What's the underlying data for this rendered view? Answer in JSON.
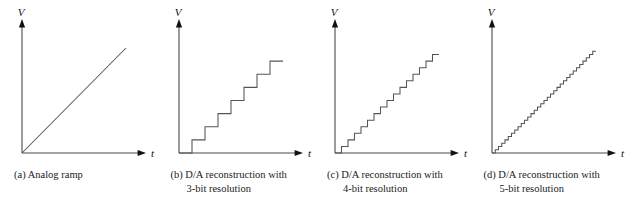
{
  "figure": {
    "background_color": "#ffffff",
    "line_color": "#555555",
    "axis_color": "#4a4a4a",
    "text_color": "#1a1a1a",
    "axis_labels": {
      "y": "V",
      "x": "t"
    }
  },
  "panels": [
    {
      "id": "panel-a",
      "caption_line_1": "(a) Analog ramp",
      "caption_line_2": "",
      "chart_index": 0
    },
    {
      "id": "panel-b",
      "caption_line_1": "(b) D/A reconstruction with",
      "caption_line_2": "3-bit resolution",
      "chart_index": 1
    },
    {
      "id": "panel-c",
      "caption_line_1": "(c) D/A reconstruction with",
      "caption_line_2": "4-bit resolution",
      "chart_index": 2
    },
    {
      "id": "panel-d",
      "caption_line_1": "(d) D/A reconstruction with",
      "caption_line_2": "5-bit resolution",
      "chart_index": 3
    }
  ],
  "chart_data": [
    {
      "type": "line",
      "title": "(a) Analog ramp",
      "xlabel": "t",
      "ylabel": "V",
      "grid": false,
      "legend": "none",
      "waveform": "ramp",
      "steps": 0,
      "xlim": [
        0,
        1
      ],
      "ylim": [
        0,
        1
      ],
      "x": [
        0,
        1
      ],
      "values": [
        0,
        1
      ],
      "description": "Continuous linear analog ramp from origin"
    },
    {
      "type": "line",
      "title": "(b) D/A reconstruction with 3-bit resolution",
      "xlabel": "t",
      "ylabel": "V",
      "grid": false,
      "legend": "none",
      "waveform": "staircase",
      "bits": 3,
      "steps": 8,
      "xlim": [
        0,
        1
      ],
      "ylim": [
        0,
        1
      ],
      "x": [
        0,
        0.125,
        0.25,
        0.375,
        0.5,
        0.625,
        0.75,
        0.875,
        1
      ],
      "values": [
        0,
        0.125,
        0.25,
        0.375,
        0.5,
        0.625,
        0.75,
        0.875,
        0.875
      ],
      "description": "Quantized staircase approximation with 8 levels"
    },
    {
      "type": "line",
      "title": "(c) D/A reconstruction with 4-bit resolution",
      "xlabel": "t",
      "ylabel": "V",
      "grid": false,
      "legend": "none",
      "waveform": "staircase",
      "bits": 4,
      "steps": 16,
      "xlim": [
        0,
        1
      ],
      "ylim": [
        0,
        1
      ],
      "x": [
        0,
        0.0625,
        0.125,
        0.1875,
        0.25,
        0.3125,
        0.375,
        0.4375,
        0.5,
        0.5625,
        0.625,
        0.6875,
        0.75,
        0.8125,
        0.875,
        0.9375,
        1
      ],
      "values": [
        0,
        0.0625,
        0.125,
        0.1875,
        0.25,
        0.3125,
        0.375,
        0.4375,
        0.5,
        0.5625,
        0.625,
        0.6875,
        0.75,
        0.8125,
        0.875,
        0.9375,
        0.9375
      ],
      "description": "Quantized staircase approximation with 16 levels"
    },
    {
      "type": "line",
      "title": "(d) D/A reconstruction with 5-bit resolution",
      "xlabel": "t",
      "ylabel": "V",
      "grid": false,
      "legend": "none",
      "waveform": "staircase",
      "bits": 5,
      "steps": 32,
      "xlim": [
        0,
        1
      ],
      "ylim": [
        0,
        1
      ],
      "x": [
        0,
        0.03125,
        0.0625,
        0.09375,
        0.125,
        0.15625,
        0.1875,
        0.21875,
        0.25,
        0.28125,
        0.3125,
        0.34375,
        0.375,
        0.40625,
        0.4375,
        0.46875,
        0.5,
        0.53125,
        0.5625,
        0.59375,
        0.625,
        0.65625,
        0.6875,
        0.71875,
        0.75,
        0.78125,
        0.8125,
        0.84375,
        0.875,
        0.90625,
        0.9375,
        0.96875,
        1
      ],
      "values": [
        0,
        0.03125,
        0.0625,
        0.09375,
        0.125,
        0.15625,
        0.1875,
        0.21875,
        0.25,
        0.28125,
        0.3125,
        0.34375,
        0.375,
        0.40625,
        0.4375,
        0.46875,
        0.5,
        0.53125,
        0.5625,
        0.59375,
        0.625,
        0.65625,
        0.6875,
        0.71875,
        0.75,
        0.78125,
        0.8125,
        0.84375,
        0.875,
        0.90625,
        0.9375,
        0.96875,
        0.96875
      ],
      "description": "Quantized staircase approximation with 32 levels"
    }
  ]
}
